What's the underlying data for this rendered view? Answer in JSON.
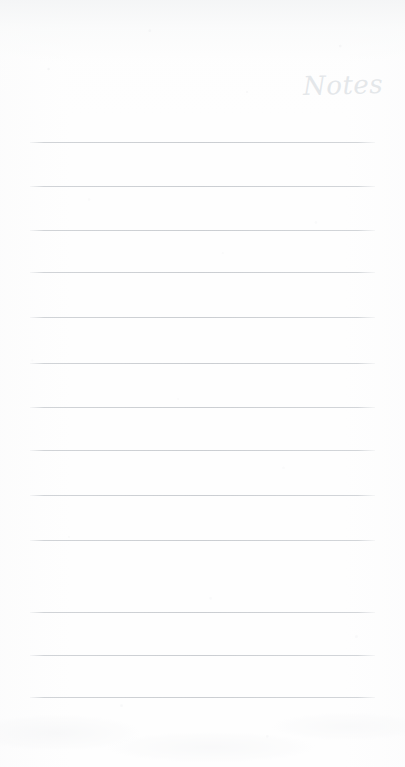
{
  "page": {
    "title": "Notes",
    "kind": "lined-notepad-page",
    "width": 405,
    "height": 767,
    "background_color": "#fefefe",
    "heading_color": "#e2e5e8",
    "rule_color": "#cbced2"
  },
  "heading": {
    "text": "Notes"
  },
  "rules": {
    "count": 13,
    "left_x": 30,
    "right_x": 375,
    "positions": [
      142,
      186,
      230,
      272,
      317,
      363,
      407,
      450,
      495,
      540,
      568,
      612,
      655,
      697
    ]
  },
  "lines": [
    {
      "index": 1,
      "y": 142,
      "content": ""
    },
    {
      "index": 2,
      "y": 186,
      "content": ""
    },
    {
      "index": 3,
      "y": 230,
      "content": ""
    },
    {
      "index": 4,
      "y": 272,
      "content": ""
    },
    {
      "index": 5,
      "y": 317,
      "content": ""
    },
    {
      "index": 6,
      "y": 363,
      "content": ""
    },
    {
      "index": 7,
      "y": 407,
      "content": ""
    },
    {
      "index": 8,
      "y": 450,
      "content": ""
    },
    {
      "index": 9,
      "y": 495,
      "content": ""
    },
    {
      "index": 10,
      "y": 540,
      "content": ""
    },
    {
      "index": 11,
      "y": 612,
      "content": ""
    },
    {
      "index": 12,
      "y": 655,
      "content": ""
    },
    {
      "index": 13,
      "y": 697,
      "content": ""
    }
  ]
}
